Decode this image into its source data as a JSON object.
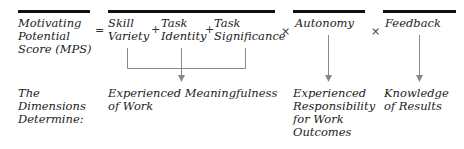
{
  "formula": {
    "lhs": [
      "Motivating",
      "Potential",
      "Score (MPS)"
    ],
    "equals": "=",
    "plus": "+",
    "times": "×",
    "terms": {
      "skill_variety": [
        "Skill",
        "Variety"
      ],
      "task_identity": [
        "Task",
        "Identity"
      ],
      "task_significance": [
        "Task",
        "Significance"
      ],
      "autonomy": "Autonomy",
      "feedback": "Feedback"
    }
  },
  "outcomes": {
    "row_label": [
      "The",
      "Dimensions",
      "Determine:"
    ],
    "meaningfulness": [
      "Experienced Meaningfulness",
      "of Work"
    ],
    "responsibility": [
      "Experienced",
      "Responsibility",
      "for Work",
      "Outcomes"
    ],
    "knowledge": [
      "Knowledge",
      "of Results"
    ]
  },
  "colors": {
    "bar": "#111111",
    "connector": "#888888",
    "text": "#222222"
  }
}
